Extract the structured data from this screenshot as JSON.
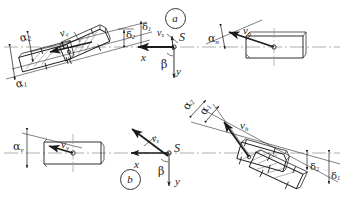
{
  "figure": {
    "background": "#ffffff",
    "line_color": "#1a1a1a",
    "center_line_color": "#9a9a9a",
    "width": 344,
    "height": 197
  },
  "panels": [
    {
      "id": "a",
      "label": "a",
      "circle_cx": 174,
      "circle_cy": 17
    },
    {
      "id": "b",
      "label": "b",
      "circle_cx": 129,
      "circle_cy": 178
    }
  ],
  "labels": [
    {
      "key": "a_alpha2",
      "text": "α",
      "sub": "2",
      "x": 20,
      "y": 33,
      "rot": -16,
      "size": 11
    },
    {
      "key": "a_alpha1",
      "text": "α",
      "sub": "1",
      "x": 16,
      "y": 79,
      "rot": -16,
      "size": 11
    },
    {
      "key": "a_vv",
      "text": "v",
      "sub": "v",
      "x": 60,
      "y": 28,
      "rot": -16,
      "size": 11
    },
    {
      "key": "a_delta2",
      "text": "δ",
      "sub": "2",
      "x": 126,
      "y": 30,
      "rot": 0,
      "size": 10
    },
    {
      "key": "a_delta1",
      "text": "δ",
      "sub": "1",
      "x": 142,
      "y": 22,
      "rot": 0,
      "size": 10
    },
    {
      "key": "a_vs",
      "text": "v",
      "sub": "s",
      "x": 157,
      "y": 28,
      "rot": 0,
      "size": 10
    },
    {
      "key": "a_S",
      "text": "S",
      "sub": "",
      "x": 179,
      "y": 31,
      "rot": 0,
      "size": 12
    },
    {
      "key": "a_x",
      "text": "x",
      "sub": "",
      "x": 141,
      "y": 52,
      "rot": 0,
      "size": 11
    },
    {
      "key": "a_beta",
      "text": "β",
      "sub": "",
      "x": 161,
      "y": 59,
      "rot": 0,
      "size": 11
    },
    {
      "key": "a_y",
      "text": "y",
      "sub": "",
      "x": 176,
      "y": 66,
      "rot": 0,
      "size": 11
    },
    {
      "key": "a_alphan",
      "text": "α",
      "sub": "n",
      "x": 208,
      "y": 33,
      "rot": 0,
      "size": 11
    },
    {
      "key": "a_vh",
      "text": "v",
      "sub": "h",
      "x": 243,
      "y": 25,
      "rot": 0,
      "size": 11
    },
    {
      "key": "b_alphav",
      "text": "α",
      "sub": "v",
      "x": 13,
      "y": 141,
      "rot": 0,
      "size": 11
    },
    {
      "key": "b_vv",
      "text": "v",
      "sub": "v",
      "x": 61,
      "y": 139,
      "rot": 0,
      "size": 11
    },
    {
      "key": "b_vs",
      "text": "v",
      "sub": "s",
      "x": 152,
      "y": 134,
      "rot": 0,
      "size": 10
    },
    {
      "key": "b_S",
      "text": "S",
      "sub": "",
      "x": 174,
      "y": 142,
      "rot": 0,
      "size": 12
    },
    {
      "key": "b_x",
      "text": "x",
      "sub": "",
      "x": 134,
      "y": 159,
      "rot": 0,
      "size": 11
    },
    {
      "key": "b_beta",
      "text": "β",
      "sub": "",
      "x": 158,
      "y": 166,
      "rot": 0,
      "size": 11
    },
    {
      "key": "b_y",
      "text": "y",
      "sub": "",
      "x": 175,
      "y": 176,
      "rot": 0,
      "size": 11
    },
    {
      "key": "b_alpha2",
      "text": "α",
      "sub": "2",
      "x": 186,
      "y": 103,
      "rot": -62,
      "size": 11
    },
    {
      "key": "b_alpha1",
      "text": "α",
      "sub": "1",
      "x": 203,
      "y": 108,
      "rot": -62,
      "size": 11
    },
    {
      "key": "b_vh",
      "text": "v",
      "sub": "h",
      "x": 240,
      "y": 120,
      "rot": 0,
      "size": 11
    },
    {
      "key": "b_delta2",
      "text": "δ",
      "sub": "2",
      "x": 310,
      "y": 162,
      "rot": 0,
      "size": 10
    },
    {
      "key": "b_delta1",
      "text": "δ",
      "sub": "1",
      "x": 331,
      "y": 171,
      "rot": 0,
      "size": 10
    }
  ],
  "symbols": {
    "alpha": "α",
    "beta": "β",
    "delta": "δ",
    "v": "v",
    "S": "S",
    "x": "x",
    "y": "y"
  }
}
